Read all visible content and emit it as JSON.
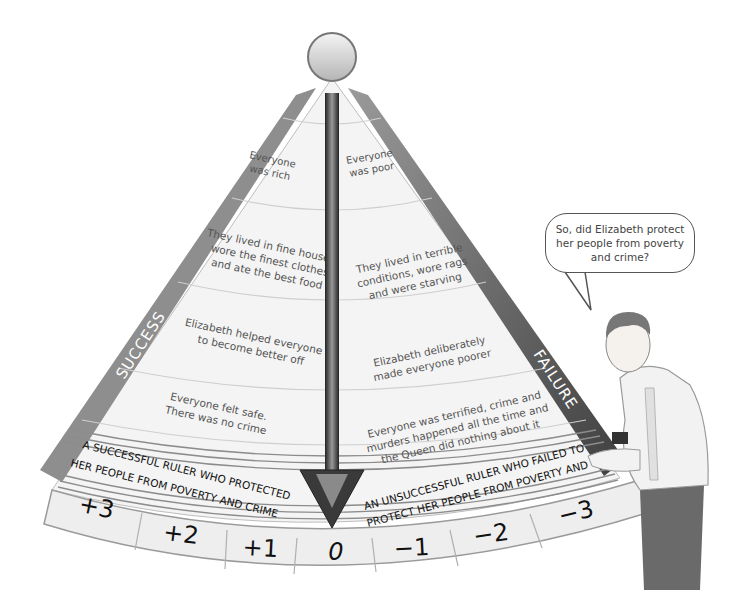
{
  "diagram": {
    "left_label": "SUCCESS",
    "right_label": "FAILURE",
    "left_rows": [
      {
        "text_line1": "Everyone",
        "text_line2": "was rich",
        "text_line3": ""
      },
      {
        "text_line1": "They lived in fine houses,",
        "text_line2": "wore the finest clothes",
        "text_line3": "and ate the best food"
      },
      {
        "text_line1": "Elizabeth helped everyone",
        "text_line2": "to become better off",
        "text_line3": ""
      },
      {
        "text_line1": "Everyone felt safe.",
        "text_line2": "There was no crime",
        "text_line3": ""
      }
    ],
    "right_rows": [
      {
        "text_line1": "Everyone",
        "text_line2": "was poor",
        "text_line3": ""
      },
      {
        "text_line1": "They lived in terrible",
        "text_line2": "conditions, wore rags",
        "text_line3": "and were starving"
      },
      {
        "text_line1": "Elizabeth deliberately",
        "text_line2": "made everyone poorer",
        "text_line3": ""
      },
      {
        "text_line1": "Everyone was terrified, crime and",
        "text_line2": "murders happened all the time and",
        "text_line3": "the Queen did nothing about it"
      }
    ],
    "left_banner": {
      "line1": "A SUCCESSFUL RULER WHO PROTECTED",
      "line2": "HER PEOPLE FROM POVERTY AND CRIME"
    },
    "right_banner": {
      "line1": "AN UNSUCCESSFUL RULER WHO FAILED TO",
      "line2": "PROTECT HER PEOPLE FROM POVERTY AND CRIME"
    },
    "scale": [
      "+3",
      "+2",
      "+1",
      "0",
      "−1",
      "−2",
      "−3"
    ],
    "speech_bubble": "So, did Elizabeth protect her people from poverty and crime?",
    "colors": {
      "band": "#8a8a8a",
      "band_dark": "#5a5a5a",
      "panel": "#f3f3f3",
      "pointer": "#3a3a3a",
      "text": "#444444"
    }
  }
}
